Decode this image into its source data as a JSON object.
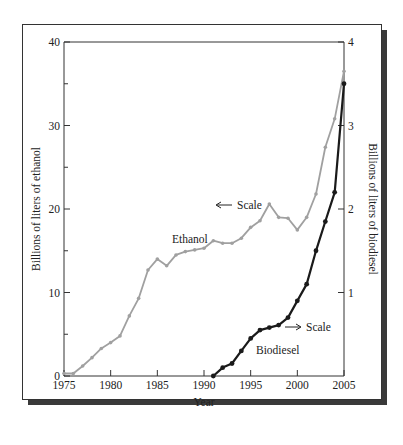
{
  "chart_data": {
    "type": "line",
    "title": "",
    "xlabel": "Year",
    "ylabel_left": "Billions of liters of ethanol",
    "ylabel_right": "Billions of liters of biodiesel",
    "x_ticks": [
      1975,
      1980,
      1985,
      1990,
      1995,
      2000,
      2005
    ],
    "y_left_ticks": [
      0,
      10,
      20,
      30,
      40
    ],
    "y_right_ticks": [
      1,
      2,
      3,
      4
    ],
    "xlim": [
      1975,
      2005
    ],
    "ylim_left": [
      0,
      40
    ],
    "ylim_right": [
      0,
      4
    ],
    "grid": false,
    "series": [
      {
        "name": "Ethanol",
        "axis": "left",
        "color": "#a0a0a0",
        "x": [
          1975,
          1976,
          1977,
          1978,
          1979,
          1980,
          1981,
          1982,
          1983,
          1984,
          1985,
          1986,
          1987,
          1988,
          1989,
          1990,
          1991,
          1992,
          1993,
          1994,
          1995,
          1996,
          1997,
          1998,
          1999,
          2000,
          2001,
          2002,
          2003,
          2004,
          2005
        ],
        "values": [
          0.3,
          0.3,
          1.2,
          2.2,
          3.3,
          4.0,
          4.8,
          7.2,
          9.3,
          12.7,
          14.0,
          13.2,
          14.5,
          14.9,
          15.1,
          15.3,
          16.2,
          15.9,
          15.9,
          16.5,
          17.8,
          18.6,
          20.6,
          19.0,
          18.9,
          17.5,
          19.0,
          21.8,
          27.4,
          30.8,
          36.5
        ]
      },
      {
        "name": "Biodiesel",
        "axis": "right",
        "color": "#1a1a1a",
        "x": [
          1991,
          1992,
          1993,
          1994,
          1995,
          1996,
          1997,
          1998,
          1999,
          2000,
          2001,
          2002,
          2003,
          2004,
          2005
        ],
        "values": [
          0.0,
          0.1,
          0.15,
          0.3,
          0.45,
          0.55,
          0.58,
          0.61,
          0.7,
          0.9,
          1.1,
          1.5,
          1.85,
          2.2,
          3.5
        ]
      }
    ],
    "annotations": [
      {
        "text": "Ethanol",
        "near": "ethanol series ~1988"
      },
      {
        "text": "Biodiesel",
        "near": "biodiesel series ~1996"
      },
      {
        "text": "← Scale",
        "meaning": "ethanol uses left axis"
      },
      {
        "text": "→ Scale",
        "meaning": "biodiesel uses right axis"
      }
    ]
  },
  "labels": {
    "ethanol": "Ethanol",
    "biodiesel": "Biodiesel",
    "scale_left": "Scale",
    "scale_right": "Scale",
    "xlabel": "Year",
    "ylabel_left": "Billions of liters of ethanol",
    "ylabel_right": "Billions of liters of biodiesel"
  }
}
